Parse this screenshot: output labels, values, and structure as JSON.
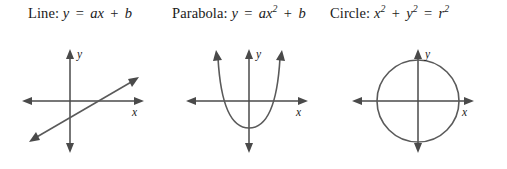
{
  "figure": {
    "background_color": "#ffffff",
    "stroke_color": "#4a4a4a",
    "curve_color": "#5a5a5a",
    "text_color": "#1a1a1a"
  },
  "panels": [
    {
      "name": "line",
      "caption": {
        "title": "Line:",
        "lhs": "y",
        "equals": "=",
        "coef": "ax",
        "plus": "+",
        "constant": "b",
        "full_text": "Line: y = ax + b"
      },
      "axes": {
        "x_label": "x",
        "y_label": "y"
      },
      "graph": {
        "type": "line",
        "equation": "y = ax + b",
        "slope_sign": "positive",
        "arrowheads": "both-ends",
        "description": "straight line with positive slope crossing both axes near the origin"
      }
    },
    {
      "name": "parabola",
      "caption": {
        "title": "Parabola:",
        "lhs": "y",
        "equals": "=",
        "coef": "ax",
        "exponent": "2",
        "plus": "+",
        "constant": "b",
        "full_text": "Parabola: y = ax2 + b"
      },
      "axes": {
        "x_label": "x",
        "y_label": "y"
      },
      "graph": {
        "type": "parabola",
        "equation": "y = ax^2 + b",
        "opens": "upward",
        "vertex_position": "below x-axis on the y-axis",
        "arrowheads": "both-branches",
        "description": "upward opening parabola with vertex below the origin crossing the x-axis twice"
      }
    },
    {
      "name": "circle",
      "caption": {
        "title": "Circle:",
        "term1": "x",
        "term1_exp": "2",
        "plus": "+",
        "term2": "y",
        "term2_exp": "2",
        "equals": "=",
        "rhs": "r",
        "rhs_exp": "2",
        "full_text": "Circle: x2 + y2 = r2"
      },
      "axes": {
        "x_label": "x",
        "y_label": "y"
      },
      "graph": {
        "type": "circle",
        "equation": "x^2 + y^2 = r^2",
        "center": "origin",
        "radius_px": 41,
        "description": "circle centered at the origin intersecting both axes symmetrically"
      }
    }
  ]
}
